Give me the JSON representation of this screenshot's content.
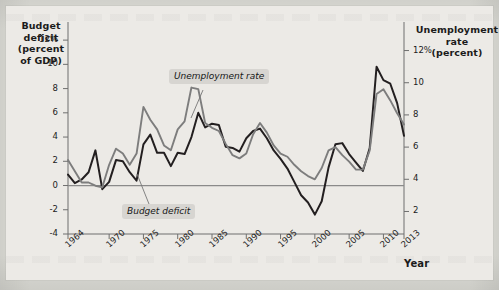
{
  "figure": {
    "left_axis_title": "Budget\ndeficit\n(percent\nof GDP)",
    "left_axis_title_lines": [
      "Budget",
      "deficit",
      "(percent",
      "of GDP)"
    ],
    "right_axis_title_lines": [
      "Unemployment",
      "rate",
      "(percent)"
    ],
    "x_axis_title": "Year",
    "callouts": [
      {
        "id": "unemployment-rate",
        "label": "Unemployment rate"
      },
      {
        "id": "budget-deficit",
        "label": "Budget deficit"
      }
    ],
    "colors": {
      "budget_deficit_line": "#231f20",
      "unemployment_line": "#7d7d7d",
      "zero_line": "#8a8a8a",
      "axis": "#6f6f6f",
      "figure_background": "#eceae6",
      "page_background": "#dcdcd6",
      "callout_background": "#d7d5d1"
    }
  },
  "chart_data": {
    "type": "line",
    "title": "",
    "xlabel": "Year",
    "grid": false,
    "legend": "annotated-callouts",
    "x": [
      1964,
      1965,
      1966,
      1967,
      1968,
      1969,
      1970,
      1971,
      1972,
      1973,
      1974,
      1975,
      1976,
      1977,
      1978,
      1979,
      1980,
      1981,
      1982,
      1983,
      1984,
      1985,
      1986,
      1987,
      1988,
      1989,
      1990,
      1991,
      1992,
      1993,
      1994,
      1995,
      1996,
      1997,
      1998,
      1999,
      2000,
      2001,
      2002,
      2003,
      2004,
      2005,
      2006,
      2007,
      2008,
      2009,
      2010,
      2011,
      2012,
      2013
    ],
    "x_tick_labels": [
      "1964",
      "1970",
      "1975",
      "1980",
      "1985",
      "1990",
      "1995",
      "2000",
      "2005",
      "2010",
      "2013"
    ],
    "x_tick_values": [
      1964,
      1970,
      1975,
      1980,
      1985,
      1990,
      1995,
      2000,
      2005,
      2010,
      2013
    ],
    "xlim": [
      1964,
      2013
    ],
    "axes": [
      {
        "id": "left",
        "label_lines": [
          "Budget",
          "deficit",
          "(percent",
          "of GDP)"
        ],
        "ylabel": "Budget deficit (percent of GDP)",
        "tick_labels": [
          "12%",
          "10",
          "8",
          "6",
          "4",
          "2",
          "0",
          "-2",
          "-4"
        ],
        "tick_values": [
          12,
          10,
          8,
          6,
          4,
          2,
          0,
          -2,
          -4
        ],
        "ylim": [
          -4,
          13
        ]
      },
      {
        "id": "right",
        "label_lines": [
          "Unemployment",
          "rate",
          "(percent)"
        ],
        "ylabel": "Unemployment rate (percent)",
        "tick_labels": [
          "12%",
          "10",
          "8",
          "6",
          "4",
          "2"
        ],
        "tick_values": [
          12,
          10,
          8,
          6,
          4,
          2
        ],
        "ylim": [
          0.6,
          13.4
        ]
      }
    ],
    "series": [
      {
        "name": "Budget deficit",
        "axis": "left",
        "color": "#231f20",
        "values": [
          0.9,
          0.2,
          0.5,
          1.1,
          2.9,
          -0.3,
          0.3,
          2.1,
          2.0,
          1.1,
          0.4,
          3.4,
          4.2,
          2.7,
          2.7,
          1.6,
          2.7,
          2.6,
          4.0,
          6.0,
          4.8,
          5.1,
          5.0,
          3.2,
          3.1,
          2.8,
          3.9,
          4.5,
          4.7,
          3.9,
          2.9,
          2.2,
          1.4,
          0.3,
          -0.8,
          -1.4,
          -2.4,
          -1.3,
          1.5,
          3.4,
          3.5,
          2.6,
          1.9,
          1.2,
          3.1,
          9.8,
          8.7,
          8.4,
          6.8,
          4.1
        ]
      },
      {
        "name": "Unemployment rate",
        "axis": "right",
        "color": "#7d7d7d",
        "values": [
          5.2,
          4.5,
          3.8,
          3.8,
          3.6,
          3.5,
          4.9,
          5.9,
          5.6,
          4.9,
          5.6,
          8.5,
          7.7,
          7.1,
          6.1,
          5.8,
          7.1,
          7.6,
          9.7,
          9.6,
          7.5,
          7.2,
          7.0,
          6.2,
          5.5,
          5.3,
          5.6,
          6.8,
          7.5,
          6.9,
          6.1,
          5.6,
          5.4,
          4.9,
          4.5,
          4.2,
          4.0,
          4.7,
          5.8,
          6.0,
          5.5,
          5.1,
          4.6,
          4.6,
          5.8,
          9.3,
          9.6,
          8.9,
          8.1,
          7.4
        ]
      }
    ],
    "annotations": [
      {
        "text": "Unemployment rate",
        "points_to_series": "Unemployment rate",
        "near_x": 1983
      },
      {
        "text": "Budget deficit",
        "points_to_series": "Budget deficit",
        "near_x": 1976
      }
    ]
  }
}
